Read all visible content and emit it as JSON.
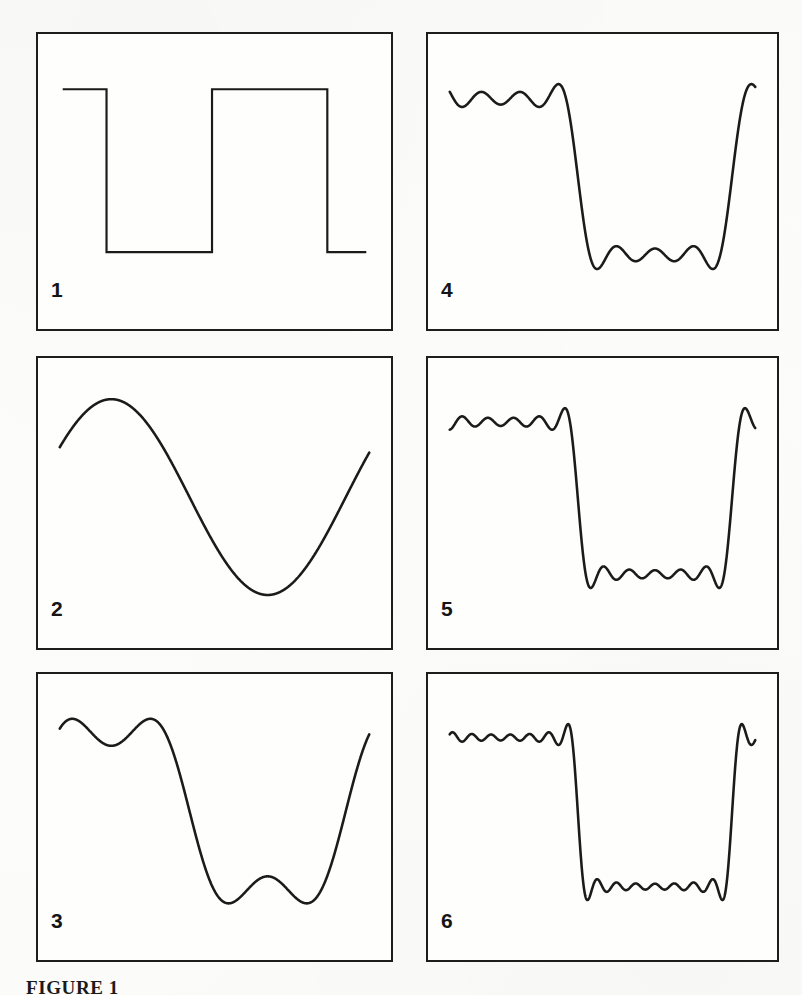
{
  "figure": {
    "caption": "FIGURE 1",
    "panel_count": 6,
    "ink_color": "#1b1b1b",
    "paper_color": "#fdfdfc"
  },
  "panels": [
    {
      "id": "panel-1",
      "label": "1",
      "kind": "target-square-wave",
      "harmonics": "ideal",
      "description": "Ideal square wave, sharp vertical transitions, flat plateaus"
    },
    {
      "id": "panel-2",
      "label": "2",
      "kind": "fourier-partial-sum",
      "harmonics": "1",
      "description": "Fundamental only: single smooth sinusoid"
    },
    {
      "id": "panel-3",
      "label": "3",
      "kind": "fourier-partial-sum",
      "harmonics": "3",
      "description": "Fundamental plus third harmonic: one ripple per plateau"
    },
    {
      "id": "panel-4",
      "label": "4",
      "kind": "fourier-partial-sum",
      "harmonics": "7",
      "description": "Through seventh harmonic: steeper edges, several ripples per plateau"
    },
    {
      "id": "panel-5",
      "label": "5",
      "kind": "fourier-partial-sum",
      "harmonics": "11",
      "description": "Through eleventh harmonic: near-vertical edges, more ripples"
    },
    {
      "id": "panel-6",
      "label": "6",
      "kind": "fourier-partial-sum",
      "harmonics": "15",
      "description": "Through fifteenth harmonic: closest approach to square wave, fine ripples"
    }
  ],
  "chart_data": {
    "type": "line",
    "xlabel": "",
    "ylabel": "",
    "grid": false,
    "legend_position": "none",
    "xlim": [
      0,
      1
    ],
    "ylim": [
      -1.35,
      1.35
    ],
    "square_wave": {
      "high_level": 1,
      "low_level": -1,
      "transition_x": [
        0.175,
        0.5,
        0.855
      ],
      "start_level": 1,
      "segments": [
        {
          "x_from": 0.04,
          "x_to": 0.175,
          "y": 1
        },
        {
          "x_from": 0.175,
          "x_to": 0.5,
          "y": -1
        },
        {
          "x_from": 0.5,
          "x_to": 0.855,
          "y": 1
        },
        {
          "x_from": 0.855,
          "x_to": 0.975,
          "y": -1
        }
      ]
    },
    "series": [
      {
        "name": "1 harmonic",
        "panel": "2",
        "terms": [
          1
        ],
        "amplitude_scale": 1.27
      },
      {
        "name": "3 harmonics",
        "panel": "3",
        "terms": [
          1,
          3
        ],
        "amplitude_scale": 1.27
      },
      {
        "name": "7 harmonics",
        "panel": "4",
        "terms": [
          1,
          3,
          5,
          7
        ],
        "amplitude_scale": 1.27
      },
      {
        "name": "11 harmonics",
        "panel": "5",
        "terms": [
          1,
          3,
          5,
          7,
          9,
          11
        ],
        "amplitude_scale": 1.27
      },
      {
        "name": "15 harmonics",
        "panel": "6",
        "terms": [
          1,
          3,
          5,
          7,
          9,
          11,
          13,
          15
        ],
        "amplitude_scale": 1.27
      }
    ],
    "annotations": [
      {
        "text": "1",
        "panel": "1",
        "position": "bottom-left"
      },
      {
        "text": "2",
        "panel": "2",
        "position": "bottom-left"
      },
      {
        "text": "3",
        "panel": "3",
        "position": "bottom-left"
      },
      {
        "text": "4",
        "panel": "4",
        "position": "bottom-left"
      },
      {
        "text": "5",
        "panel": "5",
        "position": "bottom-left"
      },
      {
        "text": "6",
        "panel": "6",
        "position": "bottom-left"
      }
    ]
  }
}
